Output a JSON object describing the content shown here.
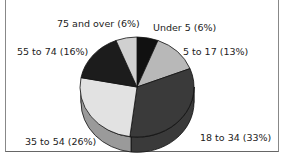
{
  "chart_data": {
    "type": "pie",
    "title": "",
    "style": "3d",
    "categories": [
      "Under 5",
      "5 to 17",
      "18 to 34",
      "35 to 54",
      "55 to 74",
      "75 and over"
    ],
    "values": [
      6,
      13,
      33,
      26,
      16,
      6
    ],
    "unit": "%",
    "colors": [
      "#111111",
      "#b8b8b8",
      "#3a3a3a",
      "#e2e2e2",
      "#1c1c1c",
      "#d0d0d0"
    ],
    "labels": [
      {
        "text": "Under 5  (6%)"
      },
      {
        "text": "5 to 17 (13%)"
      },
      {
        "text": "18 to 34 (33%)"
      },
      {
        "text": "35 to 54 (26%)"
      },
      {
        "text": "55 to 74 (16%)"
      },
      {
        "text": "75 and over (6%)"
      }
    ],
    "legend": "none"
  }
}
